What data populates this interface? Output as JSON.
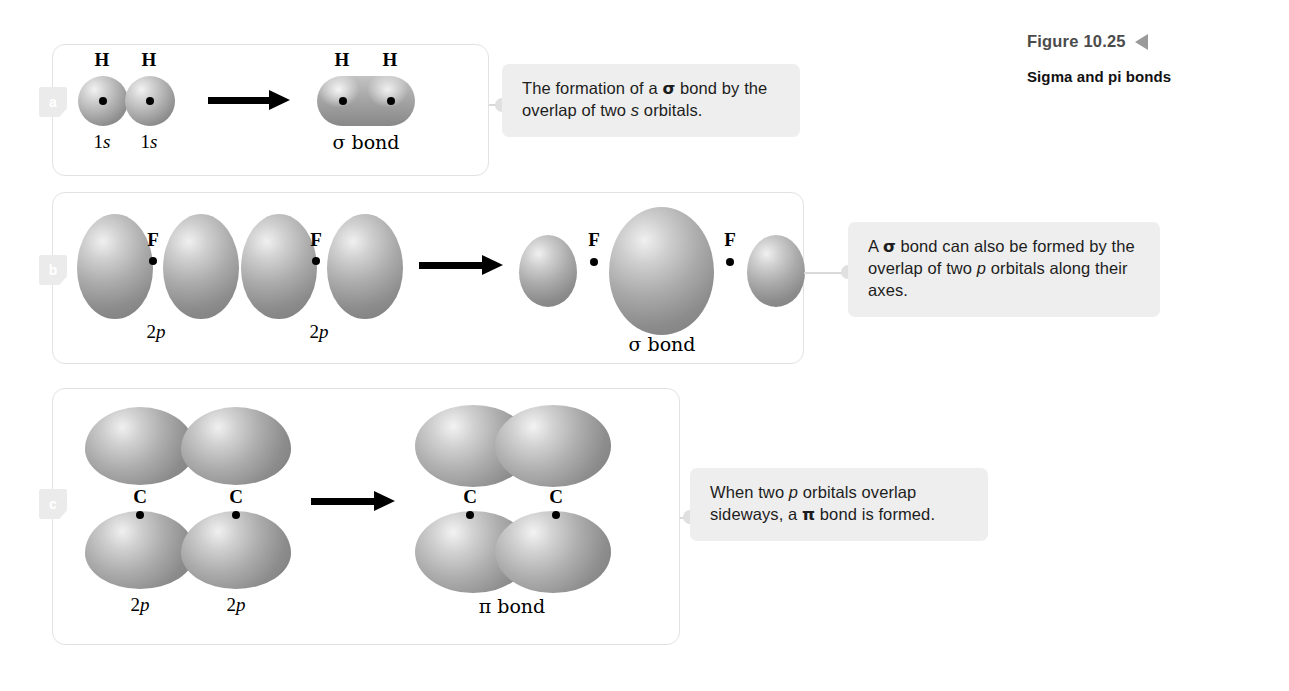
{
  "figure": {
    "number": "Figure 10.25",
    "title": "Sigma and pi bonds",
    "marker_icon": "left-triangle-icon",
    "marker_color": "#9a9a9a"
  },
  "colors": {
    "panel_border": "#e2e2e2",
    "callout_background": "#eeeeee",
    "tab_background": "#ebebeb",
    "orbital_gray": "#a6a6a6",
    "arrow": "#000000",
    "connector": "#d9d9d9"
  },
  "panels": [
    {
      "letter": "a",
      "reactant_atoms": [
        "H",
        "H"
      ],
      "reactant_orbital_labels": [
        "1s",
        "1s"
      ],
      "product_atoms": [
        "H",
        "H"
      ],
      "product_label": "σ bond",
      "callout": {
        "line1_pre": "The formation of a ",
        "line1_symbol": "σ",
        "line1_post": " bond by",
        "line2_pre": "the overlap of two ",
        "line2_italic": "s",
        "line2_post": " orbitals.",
        "full_text": "The formation of a σ bond by the overlap of two s orbitals."
      }
    },
    {
      "letter": "b",
      "reactant_atoms": [
        "F",
        "F"
      ],
      "reactant_orbital_labels": [
        "2p",
        "2p"
      ],
      "product_atoms": [
        "F",
        "F"
      ],
      "product_label": "σ bond",
      "callout": {
        "line1_pre": "A ",
        "line1_symbol": "σ",
        "line1_post": " bond can also be formed",
        "line2_pre": "by the overlap of two ",
        "line2_italic": "p",
        "line2_post": " orbitals",
        "line3": "along their axes.",
        "full_text": "A σ bond can also be formed by the overlap of two p orbitals along their axes."
      }
    },
    {
      "letter": "c",
      "reactant_atoms": [
        "C",
        "C"
      ],
      "reactant_orbital_labels": [
        "2p",
        "2p"
      ],
      "product_atoms": [
        "C",
        "C"
      ],
      "product_label": "π bond",
      "callout": {
        "line1_pre": "When two ",
        "line1_italic": "p",
        "line1_post": " orbitals overlap",
        "line2_pre": "sideways, a ",
        "line2_symbol": "π",
        "line2_post": " bond is formed.",
        "full_text": "When two p orbitals overlap sideways, a π bond is formed."
      }
    }
  ]
}
